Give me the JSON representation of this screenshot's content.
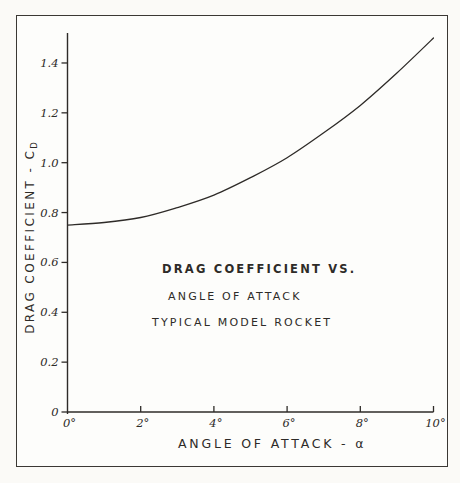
{
  "page": {
    "ink_color": "#2e2b28",
    "paper_color": "#fdfdfb",
    "frame_color": "#3b3834"
  },
  "chart_data": {
    "type": "line",
    "annotation_lines": [
      "DRAG COEFFICIENT VS.",
      "ANGLE OF ATTACK",
      "TYPICAL MODEL ROCKET"
    ],
    "xlabel": "ANGLE OF ATTACK - α",
    "ylabel": "DRAG COEFFICIENT - C",
    "ylabel_subscript": "D",
    "x": [
      0,
      1,
      2,
      3,
      4,
      5,
      6,
      7,
      8,
      9,
      10
    ],
    "series": [
      {
        "name": "drag-coefficient-curve",
        "values": [
          0.75,
          0.76,
          0.78,
          0.82,
          0.87,
          0.94,
          1.02,
          1.12,
          1.23,
          1.36,
          1.5
        ]
      }
    ],
    "xticks": [
      0,
      2,
      4,
      6,
      8,
      10
    ],
    "xtick_labels": [
      "0°",
      "2°",
      "4°",
      "6°",
      "8°",
      "10°"
    ],
    "yticks": [
      0,
      0.2,
      0.4,
      0.6,
      0.8,
      1.0,
      1.2,
      1.4
    ],
    "ytick_labels": [
      "0",
      "0.2",
      "0.4",
      "0.6",
      "0.8",
      "1.0",
      "1.2",
      "1.4"
    ],
    "xlim": [
      0,
      10
    ],
    "ylim": [
      0,
      1.52
    ],
    "grid": false,
    "legend": false
  }
}
